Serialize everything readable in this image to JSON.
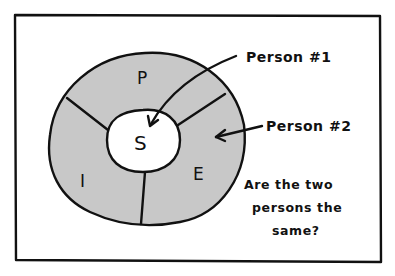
{
  "diagram": {
    "segments": [
      {
        "id": "P",
        "label": "P"
      },
      {
        "id": "I",
        "label": "I"
      },
      {
        "id": "E",
        "label": "E"
      }
    ],
    "center": {
      "label": "S"
    },
    "callouts": [
      {
        "label": "Person #1",
        "target": "S"
      },
      {
        "label": "Person #2",
        "target": "E"
      }
    ],
    "question": {
      "lines": [
        "Are the two",
        "persons the",
        "same?"
      ]
    },
    "colors": {
      "ring_fill": "#c8c8c8",
      "center_fill": "#ffffff",
      "ink": "#111111",
      "background": "#ffffff"
    }
  }
}
